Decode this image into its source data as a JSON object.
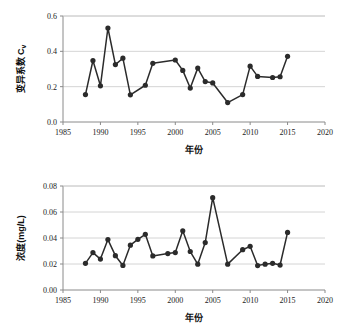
{
  "figure": {
    "background": "#ffffff",
    "line_color": "#2b2b2b",
    "grid_color": "#c9c9c9",
    "axis_color": "#8a8a8a"
  },
  "chart_data": [
    {
      "type": "line",
      "id": "cv-chart",
      "title": "",
      "xlabel": "年份",
      "ylabel": "变异系数 Cv",
      "ylabel_main": "变异系数 C",
      "ylabel_sub": "v",
      "xlim": [
        1985,
        2020
      ],
      "ylim": [
        0.0,
        0.6
      ],
      "xticks": [
        1985,
        1990,
        1995,
        2000,
        2005,
        2010,
        2015,
        2020
      ],
      "xticklabels": [
        "1985",
        "1990",
        "1995",
        "2000",
        "2005",
        "2010",
        "2015",
        "2020"
      ],
      "yticks": [
        0.0,
        0.2,
        0.4,
        0.6
      ],
      "yticklabels": [
        "0.0",
        "0.2",
        "0.4",
        "0.6"
      ],
      "grid": true,
      "legend": "none",
      "marker": "circle",
      "x": [
        1988,
        1989,
        1990,
        1991,
        1992,
        1993,
        1994,
        1996,
        1997,
        2000,
        2001,
        2002,
        2003,
        2004,
        2005,
        2007,
        2009,
        2010,
        2011,
        2013,
        2014,
        2015
      ],
      "values": [
        0.155,
        0.348,
        0.205,
        0.532,
        0.325,
        0.361,
        0.154,
        0.208,
        0.332,
        0.351,
        0.292,
        0.192,
        0.305,
        0.229,
        0.221,
        0.11,
        0.155,
        0.316,
        0.258,
        0.252,
        0.256,
        0.372
      ]
    },
    {
      "type": "line",
      "id": "concentration-chart",
      "title": "",
      "xlabel": "年份",
      "ylabel": "浓度(mg/L)",
      "xlim": [
        1985,
        2020
      ],
      "ylim": [
        0.0,
        0.08
      ],
      "xticks": [
        1985,
        1990,
        1995,
        2000,
        2005,
        2010,
        2015,
        2020
      ],
      "xticklabels": [
        "1985",
        "1990",
        "1995",
        "2000",
        "2005",
        "2010",
        "2015",
        "2020"
      ],
      "yticks": [
        0.0,
        0.02,
        0.04,
        0.06,
        0.08
      ],
      "yticklabels": [
        "0.00",
        "0.02",
        "0.04",
        "0.06",
        "0.08"
      ],
      "grid": true,
      "legend": "none",
      "marker": "circle",
      "x": [
        1988,
        1989,
        1990,
        1991,
        1992,
        1993,
        1994,
        1995,
        1996,
        1997,
        1999,
        2000,
        2001,
        2002,
        2003,
        2004,
        2005,
        2007,
        2009,
        2010,
        2011,
        2012,
        2013,
        2014,
        2015
      ],
      "values": [
        0.0205,
        0.0288,
        0.0238,
        0.0388,
        0.0264,
        0.0189,
        0.0345,
        0.039,
        0.0428,
        0.0262,
        0.028,
        0.0288,
        0.0455,
        0.0296,
        0.0199,
        0.0365,
        0.071,
        0.0199,
        0.031,
        0.0336,
        0.0188,
        0.0199,
        0.0205,
        0.0192,
        0.0443
      ]
    }
  ]
}
